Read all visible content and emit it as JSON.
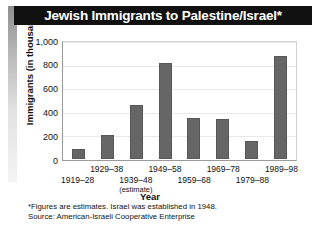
{
  "title": "Jewish Immigrants to Palestine/Israel*",
  "axes": {
    "ylabel": "Immigrants (in thousands)",
    "xlabel": "Year",
    "yticks": [
      "1,000",
      "800",
      "600",
      "400",
      "200",
      "0"
    ]
  },
  "notes": [
    "*Figures are estimates. Israel was established in 1948.",
    "Source: American-Israeli Cooperative Enterprise"
  ],
  "colors": {
    "bar": "#666666",
    "banner": "#111111",
    "banner_text": "#ffffff",
    "grid": "#e8e8e8",
    "axis": "#9a9a9a"
  },
  "chart_data": {
    "type": "bar",
    "title": "Jewish Immigrants to Palestine/Israel*",
    "xlabel": "Year",
    "ylabel": "Immigrants (in thousands)",
    "ylim": [
      0,
      1000
    ],
    "ytick_values": [
      0,
      200,
      400,
      600,
      800,
      1000
    ],
    "grid": true,
    "legend": "none",
    "categories": [
      "1919–28",
      "1929–38",
      "1939–48",
      "1949–58",
      "1959–68",
      "1969–78",
      "1979–88",
      "1989–98"
    ],
    "category_notes": [
      "",
      "",
      "(estimate)",
      "",
      "",
      "",
      "",
      ""
    ],
    "values": [
      85,
      200,
      460,
      810,
      345,
      335,
      155,
      875
    ],
    "units": "thousands of immigrants"
  }
}
